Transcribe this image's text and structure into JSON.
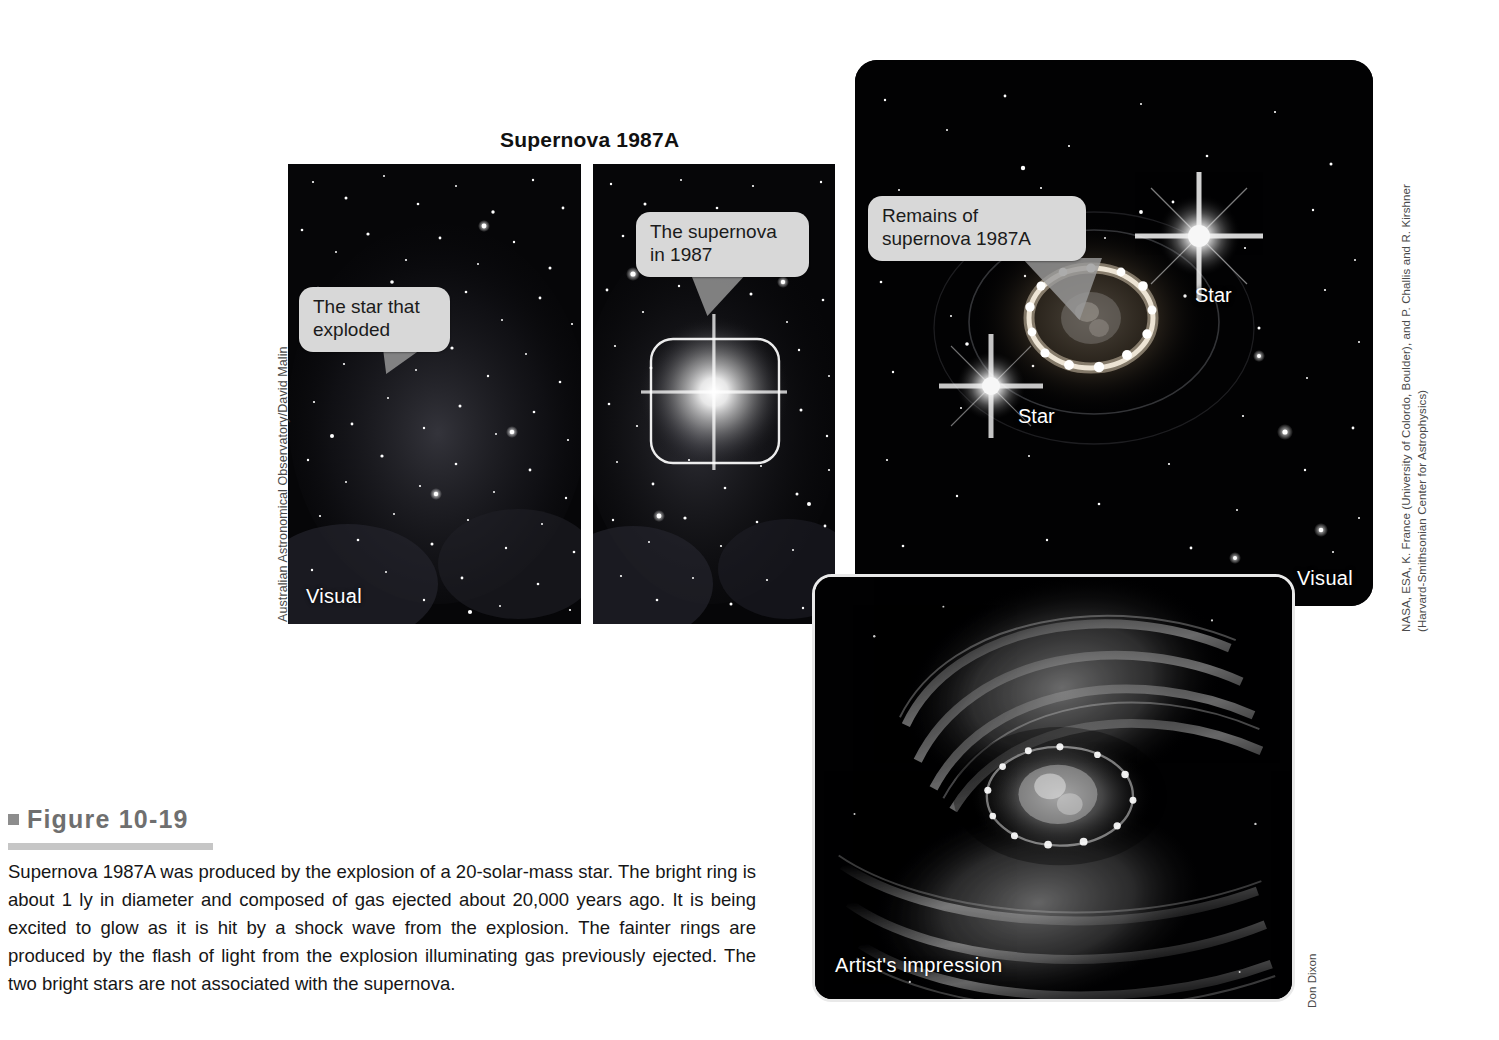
{
  "figure": {
    "title": "Supernova 1987A",
    "number_bullet": "square-bullet",
    "number": "Figure 10-19",
    "caption": "Supernova 1987A was produced by the explosion of a 20-solar-mass star. The bright ring is about 1 ly in diameter and composed of gas ejected about 20,000 years ago. It is being excited to glow as it is hit by a shock wave from the explosion. The fainter rings are produced by the flash of light from the explosion illuminating gas previously ejected. The two bright stars are not associated with the supernova."
  },
  "panels": {
    "before": {
      "name": "before-explosion-photo",
      "label": "Visual",
      "callout": "The star that\nexploded"
    },
    "during": {
      "name": "supernova-1987-photo",
      "callout": "The supernova\nin 1987",
      "highlight_box": "supernova-highlight-box"
    },
    "remnant": {
      "name": "remnant-hubble-photo",
      "label": "Visual",
      "callout": "Remains of\nsupernova 1987A",
      "star_label_top": "Star",
      "star_label_bottom": "Star"
    },
    "artwork": {
      "name": "artist-impression-art",
      "label": "Artist's impression"
    }
  },
  "credits": {
    "left": "Australian Astronomical Observatory/David Malin",
    "right_line1": "NASA, ESA, K. France (University of Colordo, Boulder), and P. Challis and R. Kirshner",
    "right_line2": "(Harvard-Smithsonian Center for Astrophysics)",
    "bottom_right": "Don Dixon"
  },
  "colors": {
    "bubble_bg": "#d8d8d8",
    "pointer": "#9a9a9a",
    "fig_num": "#6f6f6f",
    "rule": "#c6c6c6",
    "space": "#050507"
  }
}
